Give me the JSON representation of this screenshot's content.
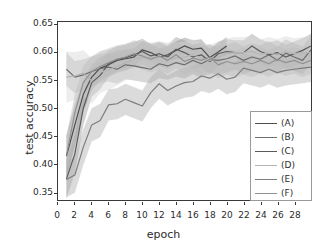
{
  "chart_data": {
    "type": "line",
    "title": "",
    "xlabel": "epoch",
    "ylabel": "test accuracy",
    "xlim": [
      0,
      30
    ],
    "ylim": [
      0.335,
      0.655
    ],
    "grid": false,
    "legend_position": "center right",
    "xticks": [
      0,
      2,
      4,
      6,
      8,
      10,
      12,
      14,
      16,
      18,
      20,
      22,
      24,
      26,
      28
    ],
    "yticks": [
      0.35,
      0.4,
      0.45,
      0.5,
      0.55,
      0.6,
      0.65
    ],
    "ytick_labels": [
      "0.35",
      "0.40",
      "0.45",
      "0.50",
      "0.55",
      "0.60",
      "0.65"
    ],
    "xtick_labels": [
      "0",
      "2",
      "4",
      "6",
      "8",
      "10",
      "12",
      "14",
      "16",
      "18",
      "20",
      "22",
      "24",
      "26",
      "28"
    ],
    "band_note": "each series drawn with shaded standard-deviation band",
    "series": [
      {
        "name": "(A)",
        "color": "#4d4d4d",
        "band_color": "#8c8c8c",
        "x": [
          1,
          2,
          3,
          4,
          5,
          6,
          7,
          8,
          9,
          10,
          11,
          12,
          13,
          14,
          15,
          16,
          17,
          18,
          19,
          20,
          21,
          22,
          23,
          24,
          25,
          26,
          27,
          28,
          29,
          30
        ],
        "values": [
          0.414,
          0.47,
          0.525,
          0.556,
          0.572,
          0.578,
          0.586,
          0.589,
          0.592,
          0.605,
          0.6,
          0.592,
          0.596,
          0.604,
          0.612,
          0.606,
          0.608,
          0.591,
          0.601,
          0.612,
          null,
          null,
          null,
          null,
          null,
          null,
          null,
          null,
          null,
          null
        ],
        "band_lo": [
          0.375,
          0.432,
          0.495,
          0.532,
          0.551,
          0.559,
          0.568,
          0.572,
          0.576,
          0.588,
          0.584,
          0.577,
          0.581,
          0.589,
          0.597,
          0.591,
          0.592,
          0.576,
          0.586,
          0.597,
          null,
          null,
          null,
          null,
          null,
          null,
          null,
          null,
          null,
          null
        ],
        "band_hi": [
          0.452,
          0.508,
          0.552,
          0.579,
          0.592,
          0.597,
          0.604,
          0.606,
          0.608,
          0.621,
          0.616,
          0.608,
          0.612,
          0.62,
          0.627,
          0.622,
          0.624,
          0.607,
          0.617,
          0.628,
          null,
          null,
          null,
          null,
          null,
          null,
          null,
          null,
          null,
          null
        ]
      },
      {
        "name": "(B)",
        "color": "#6e6e6e",
        "band_color": "#a8a8a8",
        "x": [
          1,
          2,
          3,
          4,
          5,
          6,
          7,
          8,
          9,
          10,
          11,
          12,
          13,
          14,
          15,
          16,
          17,
          18,
          19,
          20,
          21,
          22,
          23,
          24,
          25,
          26,
          27,
          28,
          29,
          30
        ],
        "values": [
          0.57,
          0.556,
          0.56,
          0.566,
          0.571,
          0.574,
          0.57,
          0.578,
          0.576,
          0.573,
          0.57,
          0.58,
          0.576,
          0.582,
          0.578,
          0.586,
          0.58,
          0.588,
          0.586,
          0.589,
          0.594,
          0.586,
          0.592,
          0.588,
          0.596,
          0.586,
          0.599,
          0.592,
          0.586,
          0.605
        ],
        "band_lo": [
          0.54,
          0.527,
          0.532,
          0.539,
          0.545,
          0.548,
          0.544,
          0.552,
          0.55,
          0.547,
          0.545,
          0.554,
          0.551,
          0.557,
          0.553,
          0.561,
          0.555,
          0.563,
          0.561,
          0.564,
          0.569,
          0.561,
          0.567,
          0.563,
          0.571,
          0.561,
          0.574,
          0.567,
          0.561,
          0.58
        ],
        "band_hi": [
          0.6,
          0.585,
          0.588,
          0.593,
          0.597,
          0.6,
          0.596,
          0.604,
          0.602,
          0.599,
          0.595,
          0.606,
          0.601,
          0.607,
          0.603,
          0.611,
          0.605,
          0.613,
          0.611,
          0.614,
          0.619,
          0.611,
          0.617,
          0.613,
          0.621,
          0.611,
          0.624,
          0.617,
          0.611,
          0.63
        ]
      },
      {
        "name": "(C)",
        "color": "#5a5a5a",
        "band_color": "#9b9b9b",
        "x": [
          1,
          2,
          3,
          4,
          5,
          6,
          7,
          8,
          9,
          10,
          11,
          12,
          13,
          14,
          15,
          16,
          17,
          18,
          19,
          20,
          21,
          22,
          23,
          24,
          25,
          26,
          27,
          28,
          29,
          30
        ],
        "values": [
          0.373,
          0.418,
          0.5,
          0.546,
          0.559,
          0.58,
          0.588,
          0.591,
          0.596,
          0.602,
          0.594,
          0.598,
          0.592,
          0.606,
          0.6,
          0.592,
          0.596,
          0.584,
          0.598,
          0.602,
          0.6,
          0.6,
          0.612,
          0.602,
          0.596,
          0.6,
          0.592,
          0.598,
          0.604,
          0.612
        ],
        "band_lo": [
          0.338,
          0.383,
          0.47,
          0.52,
          0.534,
          0.556,
          0.565,
          0.568,
          0.573,
          0.579,
          0.572,
          0.576,
          0.57,
          0.584,
          0.578,
          0.57,
          0.574,
          0.562,
          0.576,
          0.58,
          0.578,
          0.578,
          0.59,
          0.58,
          0.574,
          0.578,
          0.57,
          0.576,
          0.582,
          0.59
        ],
        "band_hi": [
          0.408,
          0.453,
          0.53,
          0.572,
          0.584,
          0.604,
          0.611,
          0.614,
          0.619,
          0.625,
          0.616,
          0.62,
          0.614,
          0.628,
          0.622,
          0.614,
          0.618,
          0.606,
          0.62,
          0.624,
          0.622,
          0.622,
          0.634,
          0.624,
          0.618,
          0.622,
          0.614,
          0.62,
          0.626,
          0.634
        ]
      },
      {
        "name": "(D)",
        "color": "#b5b5b5",
        "band_color": "#d6d6d6",
        "x": [
          1,
          2,
          3,
          4,
          5,
          6,
          7,
          8,
          9,
          10,
          11,
          12,
          13,
          14,
          15,
          16,
          17,
          18,
          19,
          20,
          21,
          22,
          23,
          24,
          25,
          26,
          27,
          28,
          29,
          30
        ],
        "values": [
          0.556,
          0.558,
          0.563,
          0.549,
          0.565,
          0.569,
          0.575,
          0.582,
          0.588,
          0.592,
          0.59,
          0.592,
          0.59,
          0.59,
          0.592,
          0.596,
          0.59,
          0.586,
          0.592,
          0.598,
          0.6,
          0.6,
          0.602,
          0.596,
          0.6,
          0.596,
          0.602,
          0.598,
          0.6,
          0.6
        ],
        "band_lo": [
          0.51,
          0.515,
          0.522,
          0.508,
          0.527,
          0.533,
          0.541,
          0.55,
          0.558,
          0.564,
          0.562,
          0.564,
          0.562,
          0.562,
          0.564,
          0.568,
          0.562,
          0.558,
          0.564,
          0.57,
          0.572,
          0.572,
          0.574,
          0.568,
          0.572,
          0.568,
          0.574,
          0.57,
          0.572,
          0.572
        ],
        "band_hi": [
          0.602,
          0.601,
          0.604,
          0.59,
          0.603,
          0.605,
          0.609,
          0.614,
          0.618,
          0.62,
          0.618,
          0.62,
          0.618,
          0.618,
          0.62,
          0.624,
          0.618,
          0.614,
          0.62,
          0.626,
          0.628,
          0.628,
          0.63,
          0.624,
          0.628,
          0.624,
          0.63,
          0.626,
          0.628,
          0.628
        ]
      },
      {
        "name": "(E)",
        "color": "#7d7d7d",
        "band_color": "#b0b0b0",
        "x": [
          1,
          2,
          3,
          4,
          5,
          6,
          7,
          8,
          9,
          10,
          11,
          12,
          13,
          14,
          15,
          16,
          17,
          18,
          19,
          20,
          21,
          22,
          23,
          24,
          25,
          26,
          27,
          28,
          29,
          30
        ],
        "values": [
          0.372,
          0.38,
          0.43,
          0.47,
          0.478,
          0.506,
          0.508,
          0.516,
          0.51,
          0.504,
          0.528,
          0.544,
          0.532,
          0.54,
          0.546,
          0.548,
          0.558,
          0.554,
          0.562,
          0.552,
          0.556,
          0.572,
          0.568,
          0.564,
          0.57,
          0.564,
          0.568,
          0.57,
          0.572,
          0.574
        ],
        "band_lo": [
          0.34,
          0.348,
          0.398,
          0.44,
          0.448,
          0.478,
          0.48,
          0.488,
          0.482,
          0.476,
          0.5,
          0.517,
          0.505,
          0.513,
          0.519,
          0.521,
          0.531,
          0.527,
          0.535,
          0.525,
          0.529,
          0.545,
          0.541,
          0.537,
          0.543,
          0.537,
          0.541,
          0.543,
          0.545,
          0.547
        ],
        "band_hi": [
          0.404,
          0.412,
          0.462,
          0.5,
          0.508,
          0.534,
          0.536,
          0.544,
          0.538,
          0.532,
          0.556,
          0.571,
          0.559,
          0.567,
          0.573,
          0.575,
          0.585,
          0.581,
          0.589,
          0.579,
          0.583,
          0.599,
          0.595,
          0.591,
          0.597,
          0.591,
          0.595,
          0.597,
          0.599,
          0.601
        ]
      },
      {
        "name": "(F)",
        "color": "#909090",
        "band_color": "#bdbdbd",
        "x": [
          1,
          2,
          3,
          4,
          5,
          6,
          7,
          8,
          9,
          10,
          11,
          12,
          13,
          14,
          15,
          16,
          17,
          18,
          19,
          20,
          21,
          22,
          23,
          24,
          25,
          26,
          27,
          28,
          29,
          30
        ],
        "values": [
          0.415,
          0.492,
          0.546,
          0.566,
          0.575,
          0.582,
          0.588,
          0.592,
          0.598,
          0.594,
          0.588,
          0.594,
          0.586,
          0.596,
          0.584,
          0.59,
          0.586,
          0.592,
          0.578,
          0.584,
          0.58,
          0.584,
          0.58,
          0.586,
          0.58,
          0.588,
          0.582,
          0.586,
          0.58,
          0.586
        ],
        "band_lo": [
          0.38,
          0.458,
          0.516,
          0.538,
          0.548,
          0.556,
          0.563,
          0.568,
          0.574,
          0.57,
          0.564,
          0.57,
          0.562,
          0.572,
          0.56,
          0.566,
          0.562,
          0.568,
          0.554,
          0.56,
          0.556,
          0.56,
          0.556,
          0.562,
          0.556,
          0.564,
          0.558,
          0.562,
          0.556,
          0.562
        ],
        "band_hi": [
          0.45,
          0.526,
          0.576,
          0.594,
          0.602,
          0.608,
          0.613,
          0.616,
          0.622,
          0.618,
          0.612,
          0.618,
          0.61,
          0.62,
          0.608,
          0.614,
          0.61,
          0.616,
          0.602,
          0.608,
          0.604,
          0.608,
          0.604,
          0.61,
          0.604,
          0.612,
          0.606,
          0.61,
          0.604,
          0.61
        ]
      }
    ]
  },
  "legend": {
    "items": [
      {
        "label": "(A)"
      },
      {
        "label": "(B)"
      },
      {
        "label": "(C)"
      },
      {
        "label": "(D)"
      },
      {
        "label": "(E)"
      },
      {
        "label": "(F)"
      }
    ]
  }
}
